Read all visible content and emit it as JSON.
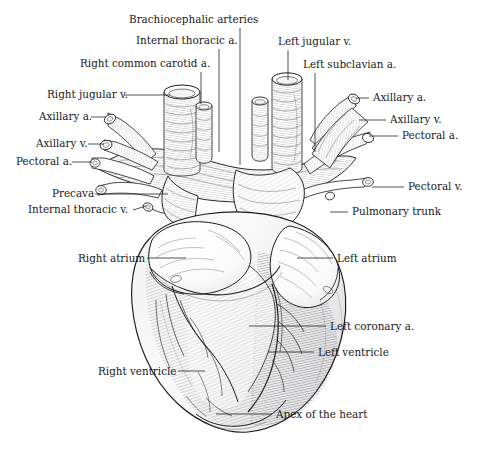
{
  "figure": {
    "title_hidden": "Ventral view of the mammalian heart and great vessels",
    "background_color": "#ffffff",
    "ink_color": "#18181a",
    "style": "engraving / line-drawing anatomical plate",
    "width": 479,
    "height": 461
  },
  "labels": [
    {
      "id": "brachiocephalic-arteries",
      "text": "Brachiocephalic arteries",
      "x": 129,
      "y": 23,
      "anchor": "start",
      "leader": {
        "type": "vertical",
        "x1": 240,
        "y1": 28,
        "x2": 240,
        "y2": 165
      }
    },
    {
      "id": "internal-thoracic-a",
      "text": "Internal thoracic a.",
      "x": 136,
      "y": 44,
      "anchor": "start",
      "leader": {
        "type": "vertical",
        "x1": 219,
        "y1": 49,
        "x2": 219,
        "y2": 152
      }
    },
    {
      "id": "right-common-carotid-a",
      "text": "Right common carotid a.",
      "x": 80,
      "y": 67,
      "anchor": "start",
      "leader": {
        "type": "vertical",
        "x1": 201,
        "y1": 72,
        "x2": 201,
        "y2": 104
      }
    },
    {
      "id": "right-jugular-v",
      "text": "Right jugular v.",
      "x": 47,
      "y": 98,
      "anchor": "start",
      "leader": {
        "type": "horizontal",
        "x1": 124,
        "y1": 95,
        "x2": 170,
        "y2": 95
      }
    },
    {
      "id": "axillary-a-left",
      "text": "Axillary a.",
      "x": 39,
      "y": 120,
      "anchor": "start",
      "leader": {
        "type": "horizontal",
        "x1": 91,
        "y1": 117,
        "x2": 106,
        "y2": 117
      }
    },
    {
      "id": "axillary-v-left",
      "text": "Axillary v.",
      "x": 36,
      "y": 147,
      "anchor": "start",
      "leader": {
        "type": "horizontal",
        "x1": 88,
        "y1": 144,
        "x2": 104,
        "y2": 144
      }
    },
    {
      "id": "pectoral-a-left",
      "text": "Pectoral a.",
      "x": 16,
      "y": 165,
      "anchor": "start",
      "leader": {
        "type": "horizontal",
        "x1": 72,
        "y1": 162,
        "x2": 92,
        "y2": 162
      }
    },
    {
      "id": "precava",
      "text": "Precava",
      "x": 52,
      "y": 197,
      "anchor": "start",
      "leader": {
        "type": "horizontal",
        "x1": 95,
        "y1": 194,
        "x2": 168,
        "y2": 194
      }
    },
    {
      "id": "internal-thoracic-v",
      "text": "Internal thoracic v.",
      "x": 28,
      "y": 213,
      "anchor": "start",
      "leader": {
        "type": "horizontal",
        "x1": 133,
        "y1": 209,
        "x2": 145,
        "y2": 206
      }
    },
    {
      "id": "left-jugular-v",
      "text": "Left jugular v.",
      "x": 278,
      "y": 45,
      "anchor": "start",
      "leader": {
        "type": "vertical",
        "x1": 288,
        "y1": 50,
        "x2": 288,
        "y2": 80
      }
    },
    {
      "id": "left-subclavian-a",
      "text": "Left subclavian a.",
      "x": 303,
      "y": 68,
      "anchor": "start",
      "leader": {
        "type": "vertical",
        "x1": 315,
        "y1": 73,
        "x2": 315,
        "y2": 152
      }
    },
    {
      "id": "axillary-a-right",
      "text": "Axillary a.",
      "x": 373,
      "y": 101,
      "anchor": "start",
      "leader": {
        "type": "horizontal",
        "x1": 356,
        "y1": 98,
        "x2": 369,
        "y2": 98
      }
    },
    {
      "id": "axillary-v-right",
      "text": "Axillary v.",
      "x": 390,
      "y": 123,
      "anchor": "start",
      "leader": {
        "type": "horizontal",
        "x1": 359,
        "y1": 120,
        "x2": 386,
        "y2": 120
      }
    },
    {
      "id": "pectoral-a-right",
      "text": "Pectoral a.",
      "x": 402,
      "y": 139,
      "anchor": "start",
      "leader": {
        "type": "horizontal",
        "x1": 369,
        "y1": 136,
        "x2": 398,
        "y2": 136
      }
    },
    {
      "id": "pectoral-v-right",
      "text": "Pectoral v.",
      "x": 408,
      "y": 190,
      "anchor": "start",
      "leader": {
        "type": "diagonal",
        "x1": 372,
        "y1": 187,
        "x2": 404,
        "y2": 187
      }
    },
    {
      "id": "pulmonary-trunk",
      "text": "Pulmonary trunk",
      "x": 352,
      "y": 215,
      "anchor": "start",
      "leader": {
        "type": "diagonal",
        "x1": 330,
        "y1": 212,
        "x2": 348,
        "y2": 212
      }
    },
    {
      "id": "right-atrium",
      "text": "Right atrium",
      "x": 78,
      "y": 262,
      "anchor": "start",
      "leader": {
        "type": "horizontal",
        "x1": 147,
        "y1": 258,
        "x2": 186,
        "y2": 258
      }
    },
    {
      "id": "left-atrium",
      "text": "Left atrium",
      "x": 337,
      "y": 262,
      "anchor": "start",
      "leader": {
        "type": "horizontal",
        "x1": 297,
        "y1": 258,
        "x2": 333,
        "y2": 258
      }
    },
    {
      "id": "left-coronary-a",
      "text": "Left coronary a.",
      "x": 330,
      "y": 330,
      "anchor": "start",
      "leader": {
        "type": "horizontal",
        "x1": 249,
        "y1": 326,
        "x2": 326,
        "y2": 326
      }
    },
    {
      "id": "left-ventricle",
      "text": "Left ventricle",
      "x": 318,
      "y": 356,
      "anchor": "start",
      "leader": {
        "type": "horizontal",
        "x1": 268,
        "y1": 352,
        "x2": 314,
        "y2": 352
      }
    },
    {
      "id": "right-ventricle",
      "text": "Right ventricle",
      "x": 98,
      "y": 375,
      "anchor": "start",
      "leader": {
        "type": "horizontal",
        "x1": 178,
        "y1": 371,
        "x2": 205,
        "y2": 371
      }
    },
    {
      "id": "apex-of-the-heart",
      "text": "Apex of the heart",
      "x": 276,
      "y": 418,
      "anchor": "start",
      "leader": {
        "type": "horizontal",
        "x1": 216,
        "y1": 414,
        "x2": 272,
        "y2": 414
      }
    }
  ],
  "structures": [
    {
      "id": "right-jugular-vein-tube",
      "name": "Right jugular v. cut stump"
    },
    {
      "id": "right-common-carotid-tube",
      "name": "Right common carotid a. cut stump"
    },
    {
      "id": "left-jugular-vein-tube",
      "name": "Left jugular v. cut stump"
    },
    {
      "id": "left-small-vein-tube",
      "name": "small left vessel stump"
    },
    {
      "id": "left-subclavian-tube",
      "name": "Left subclavian a. cut stump"
    },
    {
      "id": "axillary-artery-branches",
      "name": "axillary and pectoral branches"
    },
    {
      "id": "precava-trunk",
      "name": "precava (superior vena cava)"
    },
    {
      "id": "pulmonary-trunk-vessel",
      "name": "pulmonary trunk"
    },
    {
      "id": "right-atrium-body",
      "name": "right atrium with auricle"
    },
    {
      "id": "left-atrium-body",
      "name": "left atrium with auricle"
    },
    {
      "id": "right-ventricle-body",
      "name": "right ventricle wall"
    },
    {
      "id": "left-ventricle-body",
      "name": "left ventricle wall"
    },
    {
      "id": "coronary-vessels",
      "name": "coronary arteries and veins"
    },
    {
      "id": "heart-apex",
      "name": "apex of the heart"
    }
  ]
}
